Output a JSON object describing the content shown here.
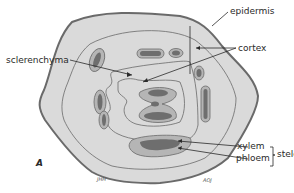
{
  "figure": {
    "letter": "A",
    "labels": {
      "epidermis": "epidermis",
      "cortex": "cortex",
      "sclerenchyma": "sclerenchyma",
      "xylem": "xylem",
      "phloem": "phloem",
      "stele": "stele"
    },
    "signatures": [
      "JHH",
      "AOJ"
    ]
  },
  "colors": {
    "tissue_fill": "#d9d9d9",
    "outline": "#6a6a6a",
    "bundle_outer": "#b5b5b5",
    "bundle_inner": "#6e6e6e",
    "text": "#2a2a2a"
  }
}
